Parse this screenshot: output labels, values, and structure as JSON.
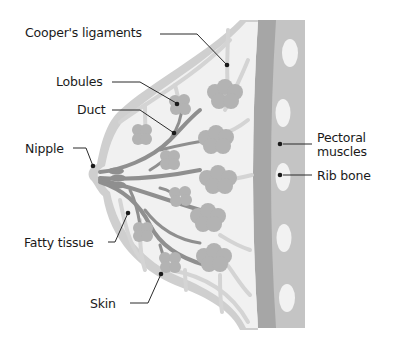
{
  "diagram": {
    "colors": {
      "background": "#ffffff",
      "tissue_fill": "#f1f1f1",
      "skin": "#cfcfcf",
      "ligament": "#d4d4d4",
      "lobule": "#b3b3b3",
      "duct": "#8f8f8f",
      "muscle_dark": "#a6a6a6",
      "chest_wall": "#c4c4c4",
      "rib": "#f2f2f2",
      "label_text": "#1a1a1a",
      "leader_line": "#2a2a2a"
    },
    "labels": [
      {
        "id": "coopers",
        "text": "Cooper's ligaments"
      },
      {
        "id": "lobules",
        "text": "Lobules"
      },
      {
        "id": "duct",
        "text": "Duct"
      },
      {
        "id": "nipple",
        "text": "Nipple"
      },
      {
        "id": "fatty",
        "text": "Fatty tissue"
      },
      {
        "id": "skin",
        "text": "Skin"
      },
      {
        "id": "pectoral_line1",
        "text": "Pectoral"
      },
      {
        "id": "pectoral_line2",
        "text": "muscles"
      },
      {
        "id": "rib",
        "text": "Rib bone"
      }
    ]
  }
}
